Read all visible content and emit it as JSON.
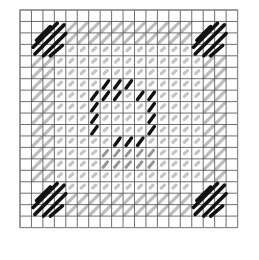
{
  "chart_data": {
    "type": "heatmap",
    "title": "",
    "grid": {
      "cols": 19,
      "rows": 19,
      "origin_x": 20,
      "origin_y": 10,
      "cell": 11.45
    },
    "legend": [
      {
        "symbol": "black-diagonal",
        "color": "#111111",
        "meaning": "dark thread full stitch"
      },
      {
        "symbol": "gray-diagonal",
        "color": "#bdbdbd",
        "meaning": "light thread full stitch"
      },
      {
        "symbol": "gray-dot",
        "color": "#c4c4c4",
        "meaning": "background tent stitch"
      },
      {
        "symbol": "black-short",
        "color": "#111111",
        "meaning": "dark motif stitch"
      },
      {
        "symbol": "dark-gray-short",
        "color": "#7a7a7a",
        "meaning": "medium motif stitch"
      }
    ],
    "corner_blocks": [
      {
        "name": "top-left",
        "col": 1,
        "row": 1,
        "size": 3
      },
      {
        "name": "top-right",
        "col": 15,
        "row": 1,
        "size": 3
      },
      {
        "name": "bottom-left",
        "col": 1,
        "row": 15,
        "size": 3
      },
      {
        "name": "bottom-right",
        "col": 15,
        "row": 15,
        "size": 3
      }
    ],
    "frame_band": {
      "outer": 1,
      "inner": 2,
      "from": 4,
      "to": 14
    },
    "motif_black": [
      [
        7,
        6
      ],
      [
        8,
        6
      ],
      [
        9,
        6
      ],
      [
        6,
        7
      ],
      [
        7,
        7
      ],
      [
        8,
        7
      ],
      [
        10,
        7
      ],
      [
        11,
        7
      ],
      [
        6,
        8
      ],
      [
        11,
        8
      ],
      [
        6,
        9
      ],
      [
        11,
        9
      ],
      [
        6,
        10
      ],
      [
        11,
        10
      ],
      [
        8,
        11
      ],
      [
        9,
        11
      ],
      [
        10,
        11
      ]
    ],
    "motif_gray": [
      [
        7,
        12
      ],
      [
        8,
        12
      ],
      [
        9,
        12
      ],
      [
        10,
        12
      ],
      [
        11,
        12
      ],
      [
        7,
        13
      ],
      [
        8,
        13
      ],
      [
        9,
        13
      ],
      [
        10,
        13
      ],
      [
        11,
        13
      ]
    ]
  }
}
